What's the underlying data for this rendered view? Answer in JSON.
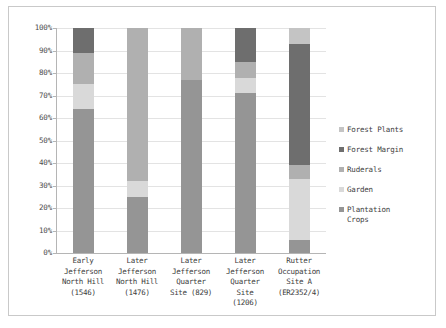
{
  "chart_data": {
    "type": "bar",
    "subtype": "stacked-percent",
    "title": "",
    "xlabel": "",
    "ylabel": "",
    "ylim": [
      0,
      100
    ],
    "ytick_labels": [
      "0%",
      "10%",
      "20%",
      "30%",
      "40%",
      "50%",
      "60%",
      "70%",
      "80%",
      "90%",
      "100%"
    ],
    "ytick_values": [
      0,
      10,
      20,
      30,
      40,
      50,
      60,
      70,
      80,
      90,
      100
    ],
    "grid": true,
    "legend_position": "right",
    "categories": [
      "Early Jefferson North Hill (1546)",
      "Later Jefferson North Hill (1476)",
      "Later Jefferson Quarter Site (829)",
      "Later Jefferson Quarter Site (1206)",
      "Rutter Occupation Site A (ER2352/4)"
    ],
    "category_lines": [
      [
        "Early",
        "Jefferson",
        "North Hill",
        "(1546)"
      ],
      [
        "Later",
        "Jefferson",
        "North Hill",
        "(1476)"
      ],
      [
        "Later",
        "Jefferson",
        "Quarter",
        "Site (829)"
      ],
      [
        "Later",
        "Jefferson",
        "Quarter",
        "Site",
        "(1206)"
      ],
      [
        "Rutter",
        "Occupation",
        "Site A",
        "(ER2352/4)"
      ]
    ],
    "series": [
      {
        "name": "Plantation Crops",
        "color": "#959595",
        "values": [
          64,
          25,
          77,
          71,
          6
        ]
      },
      {
        "name": "Garden",
        "color": "#d9d9d9",
        "values": [
          11,
          7,
          0,
          7,
          27
        ]
      },
      {
        "name": "Ruderals",
        "color": "#b0b0b0",
        "values": [
          14,
          68,
          23,
          7,
          6
        ]
      },
      {
        "name": "Forest Margin",
        "color": "#6e6e6e",
        "values": [
          11,
          0,
          0,
          15,
          54
        ]
      },
      {
        "name": "Forest Plants",
        "color": "#c4c4c4",
        "values": [
          0,
          0,
          0,
          0,
          7
        ]
      }
    ],
    "legend_entries": [
      {
        "label": "Forest Plants",
        "color": "#c4c4c4"
      },
      {
        "label": "Forest Margin",
        "color": "#6e6e6e"
      },
      {
        "label": "Ruderals",
        "color": "#b0b0b0"
      },
      {
        "label": "Garden",
        "color": "#d9d9d9"
      },
      {
        "label": "Plantation\nCrops",
        "color": "#959595"
      }
    ]
  }
}
